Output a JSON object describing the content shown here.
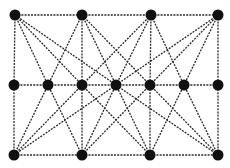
{
  "diagram": {
    "type": "graph",
    "style": {
      "node_color": "#111111",
      "edge_color": "#2a2a2a",
      "edge_style": "dashed",
      "background": "#ffffff"
    },
    "nodes": [
      {
        "id": "T0",
        "row": "top",
        "x": 15,
        "y": 15
      },
      {
        "id": "T1",
        "row": "top",
        "x": 82,
        "y": 15
      },
      {
        "id": "T2",
        "row": "top",
        "x": 151,
        "y": 15
      },
      {
        "id": "T3",
        "row": "top",
        "x": 218,
        "y": 15
      },
      {
        "id": "M0",
        "row": "middle",
        "x": 14,
        "y": 85
      },
      {
        "id": "M1",
        "row": "middle",
        "x": 48,
        "y": 85
      },
      {
        "id": "M2",
        "row": "middle",
        "x": 82,
        "y": 85
      },
      {
        "id": "M3",
        "row": "middle",
        "x": 116,
        "y": 85
      },
      {
        "id": "M4",
        "row": "middle",
        "x": 150,
        "y": 85
      },
      {
        "id": "M5",
        "row": "middle",
        "x": 184,
        "y": 85
      },
      {
        "id": "M6",
        "row": "middle",
        "x": 218,
        "y": 85
      },
      {
        "id": "B0",
        "row": "bottom",
        "x": 14,
        "y": 155
      },
      {
        "id": "B1",
        "row": "bottom",
        "x": 82,
        "y": 155
      },
      {
        "id": "B2",
        "row": "bottom",
        "x": 150,
        "y": 155
      },
      {
        "id": "B3",
        "row": "bottom",
        "x": 218,
        "y": 155
      }
    ],
    "edges": [
      [
        "T0",
        "T1"
      ],
      [
        "T1",
        "T2"
      ],
      [
        "T2",
        "T3"
      ],
      [
        "M0",
        "M1"
      ],
      [
        "M1",
        "M2"
      ],
      [
        "M2",
        "M3"
      ],
      [
        "M3",
        "M4"
      ],
      [
        "M4",
        "M5"
      ],
      [
        "M5",
        "M6"
      ],
      [
        "B0",
        "B1"
      ],
      [
        "B1",
        "B2"
      ],
      [
        "B2",
        "B3"
      ],
      [
        "T0",
        "M0"
      ],
      [
        "T0",
        "M1"
      ],
      [
        "T0",
        "M2"
      ],
      [
        "T0",
        "M3"
      ],
      [
        "T1",
        "M1"
      ],
      [
        "T1",
        "M2"
      ],
      [
        "T1",
        "M3"
      ],
      [
        "T1",
        "M4"
      ],
      [
        "T2",
        "M2"
      ],
      [
        "T2",
        "M3"
      ],
      [
        "T2",
        "M4"
      ],
      [
        "T2",
        "M5"
      ],
      [
        "T3",
        "M3"
      ],
      [
        "T3",
        "M4"
      ],
      [
        "T3",
        "M5"
      ],
      [
        "T3",
        "M6"
      ],
      [
        "B0",
        "M0"
      ],
      [
        "B0",
        "M1"
      ],
      [
        "B0",
        "M2"
      ],
      [
        "B0",
        "M3"
      ],
      [
        "B1",
        "M1"
      ],
      [
        "B1",
        "M2"
      ],
      [
        "B1",
        "M3"
      ],
      [
        "B1",
        "M4"
      ],
      [
        "B2",
        "M2"
      ],
      [
        "B2",
        "M3"
      ],
      [
        "B2",
        "M4"
      ],
      [
        "B2",
        "M5"
      ],
      [
        "B3",
        "M3"
      ],
      [
        "B3",
        "M4"
      ],
      [
        "B3",
        "M5"
      ],
      [
        "B3",
        "M6"
      ]
    ],
    "node_radius": 5.5
  }
}
